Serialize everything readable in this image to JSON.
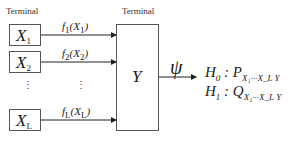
{
  "labels": {
    "left_terminal": "Terminal",
    "center_terminal": "Terminal"
  },
  "terminals": [
    {
      "symbol": "X",
      "sub": "1",
      "func": "f",
      "fsub": "1",
      "arg": "X",
      "argsup": "n",
      "argsub": "1"
    },
    {
      "symbol": "X",
      "sub": "2",
      "func": "f",
      "fsub": "2",
      "arg": "X",
      "argsup": "n",
      "argsub": "2"
    },
    {
      "symbol": "X",
      "sub": "L",
      "func": "f",
      "fsub": "L",
      "arg": "X",
      "argsup": "n",
      "argsub": "L"
    }
  ],
  "center": {
    "symbol": "Y"
  },
  "decision": {
    "symbol": "ψ"
  },
  "hypotheses": [
    {
      "h": "H",
      "hsub": "0",
      "dist": "P",
      "distsub": "X₁···X_L Y"
    },
    {
      "h": "H",
      "hsub": "1",
      "dist": "Q",
      "distsub": "X₁···X_L Y"
    }
  ],
  "ellipsis": "⋮"
}
